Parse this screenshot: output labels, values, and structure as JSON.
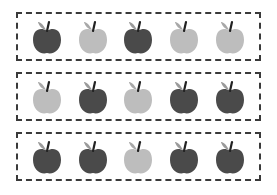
{
  "colors": {
    "dark": "#4a4a4a",
    "light": "#bdbdbd",
    "leaf_dark": "#9a9a9a",
    "leaf_light": "#a8a8a8",
    "stem": "#222222",
    "border": "#3a3a3a"
  },
  "rows": [
    {
      "apples": [
        "dark",
        "light",
        "dark",
        "light",
        "light"
      ]
    },
    {
      "apples": [
        "light",
        "dark",
        "light",
        "dark",
        "dark"
      ]
    },
    {
      "apples": [
        "dark",
        "dark",
        "light",
        "dark",
        "dark"
      ]
    }
  ]
}
